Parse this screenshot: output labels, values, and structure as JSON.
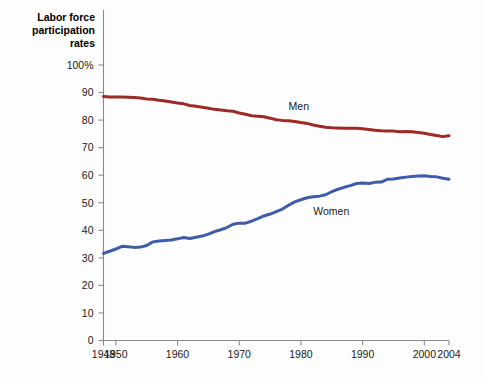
{
  "chart_data": {
    "type": "line",
    "title": "Labor force participation rates",
    "title_lines": [
      "Labor force",
      "participation",
      "rates"
    ],
    "xlabel": "",
    "ylabel": "",
    "xlim": [
      1948,
      2004
    ],
    "ylim": [
      0,
      100
    ],
    "grid": false,
    "legend_position": "inline-annotations",
    "y_ticks": [
      0,
      10,
      20,
      30,
      40,
      50,
      60,
      70,
      80,
      90,
      100
    ],
    "y_tick_labels": [
      "0",
      "10",
      "20",
      "30",
      "40",
      "50",
      "60",
      "70",
      "80",
      "90",
      "100%"
    ],
    "x_ticks": [
      1948,
      1950,
      1960,
      1970,
      1980,
      1990,
      2000,
      2004
    ],
    "x_tick_labels": [
      "1948",
      "1950",
      "1960",
      "1970",
      "1980",
      "1990",
      "2000",
      "2004"
    ],
    "x": [
      1948,
      1949,
      1950,
      1951,
      1952,
      1953,
      1954,
      1955,
      1956,
      1957,
      1958,
      1959,
      1960,
      1961,
      1962,
      1963,
      1964,
      1965,
      1966,
      1967,
      1968,
      1969,
      1970,
      1971,
      1972,
      1973,
      1974,
      1975,
      1976,
      1977,
      1978,
      1979,
      1980,
      1981,
      1982,
      1983,
      1984,
      1985,
      1986,
      1987,
      1988,
      1989,
      1990,
      1991,
      1992,
      1993,
      1994,
      1995,
      1996,
      1997,
      1998,
      1999,
      2000,
      2001,
      2002,
      2003,
      2004
    ],
    "series": [
      {
        "name": "Men",
        "color": "#9c2a26",
        "label": "Men",
        "label_x": 1978,
        "label_y": 83.5,
        "values": [
          88.6,
          88.4,
          88.4,
          88.4,
          88.3,
          88.2,
          88.0,
          87.7,
          87.6,
          87.2,
          86.9,
          86.6,
          86.2,
          85.9,
          85.3,
          85.0,
          84.7,
          84.3,
          83.9,
          83.7,
          83.4,
          83.2,
          82.6,
          82.1,
          81.6,
          81.4,
          81.2,
          80.7,
          80.1,
          79.9,
          79.8,
          79.5,
          79.1,
          78.8,
          78.2,
          77.8,
          77.4,
          77.2,
          77.1,
          77.0,
          77.0,
          77.0,
          76.9,
          76.6,
          76.3,
          76.1,
          76.0,
          76.0,
          75.8,
          75.9,
          75.8,
          75.5,
          75.2,
          74.8,
          74.4,
          74.0,
          74.3
        ]
      },
      {
        "name": "Women",
        "color": "#3f5ca8",
        "label": "Women",
        "label_x": 1982,
        "label_y": 45.5,
        "values": [
          31.6,
          32.4,
          33.2,
          34.2,
          34.0,
          33.8,
          33.9,
          34.5,
          35.8,
          36.1,
          36.3,
          36.5,
          36.9,
          37.4,
          37.0,
          37.5,
          37.9,
          38.6,
          39.5,
          40.2,
          41.0,
          42.2,
          42.6,
          42.6,
          43.3,
          44.2,
          45.2,
          45.9,
          46.8,
          47.7,
          49.1,
          50.3,
          51.1,
          51.8,
          52.2,
          52.4,
          52.9,
          54.0,
          54.9,
          55.6,
          56.2,
          57.0,
          57.2,
          57.0,
          57.4,
          57.5,
          58.5,
          58.6,
          59.0,
          59.3,
          59.5,
          59.7,
          59.8,
          59.5,
          59.4,
          58.9,
          58.5
        ]
      }
    ]
  },
  "figure": {
    "background_color": "#fdfdfd",
    "axis_color": "#8a8a8a",
    "text_color": "#1a1a1a"
  }
}
